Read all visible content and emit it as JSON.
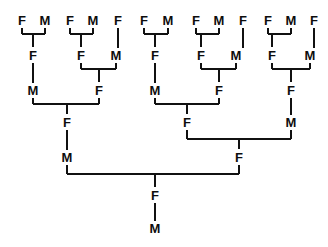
{
  "figure": {
    "type": "pedigree-chart",
    "width": 328,
    "height": 247,
    "background_color": "#ffffff",
    "line_color": "#111111",
    "text_color": "#0d0d0d",
    "generations": 7,
    "symbols": {
      "female": "F",
      "male": "M"
    }
  },
  "chart_data": {
    "type": "diagram",
    "title": "",
    "orientation": "top-down",
    "generation_rows": [
      {
        "row": 1,
        "y": 20,
        "count": 13
      },
      {
        "row": 2,
        "y": 55,
        "count": 8
      },
      {
        "row": 3,
        "y": 90,
        "count": 5
      },
      {
        "row": 4,
        "y": 122,
        "count": 3
      },
      {
        "row": 5,
        "y": 157,
        "count": 2
      },
      {
        "row": 6,
        "y": 195,
        "count": 1
      },
      {
        "row": 7,
        "y": 228,
        "count": 1
      }
    ],
    "nodes": [
      {
        "id": "g1n1",
        "label": "F",
        "x": 22,
        "y": 20,
        "row": 1
      },
      {
        "id": "g1n2",
        "label": "M",
        "x": 45,
        "y": 20,
        "row": 1
      },
      {
        "id": "g1n3",
        "label": "F",
        "x": 70,
        "y": 20,
        "row": 1
      },
      {
        "id": "g1n4",
        "label": "M",
        "x": 93,
        "y": 20,
        "row": 1
      },
      {
        "id": "g1n5",
        "label": "F",
        "x": 118,
        "y": 20,
        "row": 1
      },
      {
        "id": "g1n6",
        "label": "F",
        "x": 144,
        "y": 20,
        "row": 1
      },
      {
        "id": "g1n7",
        "label": "M",
        "x": 168,
        "y": 20,
        "row": 1
      },
      {
        "id": "g1n8",
        "label": "F",
        "x": 196,
        "y": 20,
        "row": 1
      },
      {
        "id": "g1n9",
        "label": "M",
        "x": 219,
        "y": 20,
        "row": 1
      },
      {
        "id": "g1n10",
        "label": "F",
        "x": 243,
        "y": 20,
        "row": 1
      },
      {
        "id": "g1n11",
        "label": "F",
        "x": 268,
        "y": 20,
        "row": 1
      },
      {
        "id": "g1n12",
        "label": "M",
        "x": 291,
        "y": 20,
        "row": 1
      },
      {
        "id": "g1n13",
        "label": "F",
        "x": 314,
        "y": 20,
        "row": 1
      },
      {
        "id": "g2n1",
        "label": "F",
        "x": 33,
        "y": 55,
        "row": 2
      },
      {
        "id": "g2n2",
        "label": "F",
        "x": 81,
        "y": 55,
        "row": 2
      },
      {
        "id": "g2n3",
        "label": "M",
        "x": 116,
        "y": 55,
        "row": 2
      },
      {
        "id": "g2n4",
        "label": "F",
        "x": 155,
        "y": 55,
        "row": 2
      },
      {
        "id": "g2n5",
        "label": "F",
        "x": 201,
        "y": 55,
        "row": 2
      },
      {
        "id": "g2n6",
        "label": "M",
        "x": 236,
        "y": 55,
        "row": 2
      },
      {
        "id": "g2n7",
        "label": "F",
        "x": 272,
        "y": 55,
        "row": 2
      },
      {
        "id": "g2n8",
        "label": "M",
        "x": 310,
        "y": 55,
        "row": 2
      },
      {
        "id": "g3n1",
        "label": "M",
        "x": 33,
        "y": 90,
        "row": 3
      },
      {
        "id": "g3n2",
        "label": "F",
        "x": 99,
        "y": 90,
        "row": 3
      },
      {
        "id": "g3n3",
        "label": "M",
        "x": 155,
        "y": 90,
        "row": 3
      },
      {
        "id": "g3n4",
        "label": "F",
        "x": 219,
        "y": 90,
        "row": 3
      },
      {
        "id": "g3n5",
        "label": "F",
        "x": 291,
        "y": 90,
        "row": 3
      },
      {
        "id": "g4n1",
        "label": "F",
        "x": 67,
        "y": 122,
        "row": 4
      },
      {
        "id": "g4n2",
        "label": "F",
        "x": 187,
        "y": 122,
        "row": 4
      },
      {
        "id": "g4n3",
        "label": "M",
        "x": 291,
        "y": 122,
        "row": 4
      },
      {
        "id": "g5n1",
        "label": "M",
        "x": 67,
        "y": 157,
        "row": 5
      },
      {
        "id": "g5n2",
        "label": "F",
        "x": 239,
        "y": 157,
        "row": 5
      },
      {
        "id": "g6n1",
        "label": "F",
        "x": 155,
        "y": 195,
        "row": 6
      },
      {
        "id": "g7n1",
        "label": "M",
        "x": 155,
        "y": 228,
        "row": 7
      }
    ],
    "unions": [
      {
        "parents": [
          "g1n1",
          "g1n2"
        ],
        "child": "g2n1",
        "bar_y": 34,
        "left_x": 22,
        "right_x": 45,
        "child_x": 33
      },
      {
        "parents": [
          "g1n3",
          "g1n4"
        ],
        "child": "g2n2",
        "bar_y": 34,
        "left_x": 70,
        "right_x": 93,
        "child_x": 81
      },
      {
        "parents": [
          "g1n6",
          "g1n7"
        ],
        "child": "g2n4",
        "bar_y": 34,
        "left_x": 144,
        "right_x": 168,
        "child_x": 155
      },
      {
        "parents": [
          "g1n8",
          "g1n9"
        ],
        "child": "g2n5",
        "bar_y": 34,
        "left_x": 196,
        "right_x": 219,
        "child_x": 201
      },
      {
        "parents": [
          "g1n11",
          "g1n12"
        ],
        "child": "g2n7",
        "bar_y": 34,
        "left_x": 268,
        "right_x": 291,
        "child_x": 272
      },
      {
        "parents": [
          "g2n2",
          "g2n3"
        ],
        "child": "g3n2",
        "bar_y": 69,
        "left_x": 81,
        "right_x": 116,
        "child_x": 99
      },
      {
        "parents": [
          "g2n5",
          "g2n6"
        ],
        "child": "g3n4",
        "bar_y": 69,
        "left_x": 201,
        "right_x": 236,
        "child_x": 219
      },
      {
        "parents": [
          "g2n7",
          "g2n8"
        ],
        "child": "g3n5",
        "bar_y": 69,
        "left_x": 272,
        "right_x": 310,
        "child_x": 291
      },
      {
        "parents": [
          "g3n1",
          "g3n2"
        ],
        "child": "g4n1",
        "bar_y": 104,
        "left_x": 33,
        "right_x": 99,
        "child_x": 67
      },
      {
        "parents": [
          "g3n3",
          "g3n4"
        ],
        "child": "g4n2",
        "bar_y": 104,
        "left_x": 155,
        "right_x": 219,
        "child_x": 187
      },
      {
        "parents": [
          "g4n2",
          "g4n3"
        ],
        "child": "g5n2",
        "bar_y": 139,
        "left_x": 187,
        "right_x": 291,
        "child_x": 239
      },
      {
        "parents": [
          "g5n1",
          "g5n2"
        ],
        "child": "g6n1",
        "bar_y": 174,
        "left_x": 67,
        "right_x": 239,
        "child_x": 155
      }
    ],
    "direct_links": [
      {
        "from": "g1n5",
        "to": "g2n3",
        "x": 118,
        "y1": 28,
        "y2": 48
      },
      {
        "from": "g1n10",
        "to": "g2n6",
        "x": 243,
        "y1": 28,
        "y2": 48
      },
      {
        "from": "g1n13",
        "to": "g2n8",
        "x": 314,
        "y1": 28,
        "y2": 48
      },
      {
        "from": "g2n1",
        "to": "g3n1",
        "x": 33,
        "y1": 63,
        "y2": 83
      },
      {
        "from": "g2n4",
        "to": "g3n3",
        "x": 155,
        "y1": 63,
        "y2": 83
      },
      {
        "from": "g3n5",
        "to": "g4n3",
        "x": 291,
        "y1": 98,
        "y2": 115
      },
      {
        "from": "g4n1",
        "to": "g5n1",
        "x": 67,
        "y1": 130,
        "y2": 150
      },
      {
        "from": "g6n1",
        "to": "g7n1",
        "x": 155,
        "y1": 203,
        "y2": 221
      }
    ]
  }
}
